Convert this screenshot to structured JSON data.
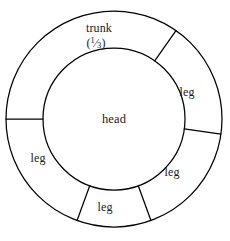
{
  "figure": {
    "name": "body-proportion-ring-diagram",
    "type": "annulus-sector-diagram",
    "background_color": "#ffffff",
    "stroke_color": "#000000",
    "text_color": "#1a1a1a",
    "center": {
      "x": 114,
      "y": 119
    },
    "outer_radius": 108,
    "inner_radius": 71,
    "center_label": "head",
    "sectors": [
      {
        "id": "trunk",
        "label": "trunk",
        "fraction_numerator": "1",
        "fraction_denominator": "3",
        "fraction_text": "(1/3)",
        "label_x": 99,
        "label_y": 28,
        "fraction_x": 96,
        "fraction_y": 43,
        "start_angle_deg": 55,
        "end_angle_deg": 180
      },
      {
        "id": "leg-right-upper",
        "label": "leg",
        "label_x": 187,
        "label_y": 92,
        "start_angle_deg": 352,
        "end_angle_deg": 55
      },
      {
        "id": "leg-right-lower",
        "label": "leg",
        "label_x": 172,
        "label_y": 172,
        "start_angle_deg": 290,
        "end_angle_deg": 352
      },
      {
        "id": "leg-bottom",
        "label": "leg",
        "label_x": 105,
        "label_y": 207,
        "start_angle_deg": 250,
        "end_angle_deg": 290
      },
      {
        "id": "leg-left-lower",
        "label": "leg",
        "label_x": 38,
        "label_y": 158,
        "start_angle_deg": 180,
        "end_angle_deg": 250
      }
    ],
    "dividers": [
      {
        "id": "divider-left",
        "angle_deg": 180
      },
      {
        "id": "divider-top-right",
        "angle_deg": 55
      },
      {
        "id": "divider-right",
        "angle_deg": 352
      },
      {
        "id": "divider-bottom-right",
        "angle_deg": 290
      },
      {
        "id": "divider-bottom-left",
        "angle_deg": 250
      }
    ]
  }
}
